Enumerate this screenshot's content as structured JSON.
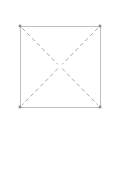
{
  "page": {
    "width": 113,
    "height": 171,
    "background_color": "#ffffff"
  },
  "figure": {
    "name": "square-with-dashed-diagonals",
    "square": {
      "x": 20,
      "y": 26,
      "width": 80,
      "height": 81,
      "stroke_color": "#b9b9b9",
      "stroke_width": 0.9,
      "fill": "none"
    },
    "corner_markers": {
      "color": "#8a8a8a",
      "size": 2.6,
      "points": [
        {
          "name": "top-left",
          "x": 20,
          "y": 26
        },
        {
          "name": "top-right",
          "x": 100,
          "y": 26
        },
        {
          "name": "bottom-left",
          "x": 20,
          "y": 107
        },
        {
          "name": "bottom-right",
          "x": 100,
          "y": 107
        }
      ]
    },
    "diagonals": {
      "stroke_color": "#9d9d9d",
      "stroke_width": 0.9,
      "dash_pattern": "4 3",
      "center": {
        "x": 60,
        "y": 66.5
      },
      "center_gap": 3,
      "segments": [
        {
          "name": "top-left-to-center",
          "x1": 22.2,
          "y1": 28.2,
          "x2": 57.9,
          "y2": 64.4
        },
        {
          "name": "center-to-bottom-right",
          "x1": 62.1,
          "y1": 68.6,
          "x2": 97.8,
          "y2": 104.8
        },
        {
          "name": "top-right-to-center",
          "x1": 97.8,
          "y1": 28.2,
          "x2": 62.1,
          "y2": 64.4
        },
        {
          "name": "center-to-bottom-left",
          "x1": 57.9,
          "y1": 68.6,
          "x2": 22.2,
          "y2": 104.8
        }
      ]
    }
  }
}
